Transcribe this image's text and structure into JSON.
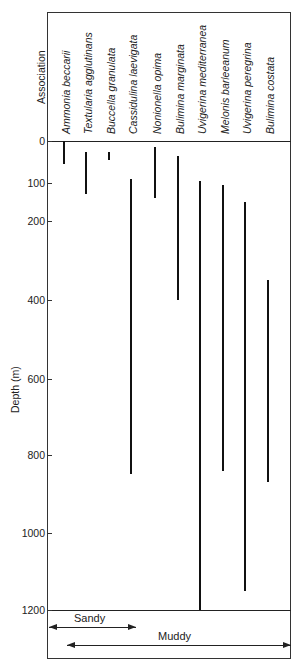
{
  "chart_data": {
    "type": "range-bar",
    "title": "",
    "xlabel": "Association",
    "ylabel": "Depth (m)",
    "ylim": [
      0,
      1200
    ],
    "y_inverted": true,
    "grid": false,
    "yticks": [
      0,
      100,
      200,
      400,
      600,
      800,
      1000,
      1200
    ],
    "categories": [
      "Ammonia beccarii",
      "Textularia agglutinans",
      "Buccella granulata",
      "Cassidulina laevigata",
      "Nonionella opima",
      "Bulimina marginata",
      "Uvigerina mediterranea",
      "Melonis barleeanum",
      "Uvigerina peregrina",
      "Bulimina costata"
    ],
    "ranges": [
      {
        "species": "Ammonia beccarii",
        "top": 0,
        "bottom": 55
      },
      {
        "species": "Textularia agglutinans",
        "top": 25,
        "bottom": 130
      },
      {
        "species": "Buccella granulata",
        "top": 25,
        "bottom": 45
      },
      {
        "species": "Cassidulina laevigata",
        "top": 90,
        "bottom": 850
      },
      {
        "species": "Nonionella opima",
        "top": 15,
        "bottom": 140
      },
      {
        "species": "Bulimina marginata",
        "top": 35,
        "bottom": 400
      },
      {
        "species": "Uvigerina mediterranea",
        "top": 95,
        "bottom": 1200
      },
      {
        "species": "Melonis barleeanum",
        "top": 105,
        "bottom": 840
      },
      {
        "species": "Uvigerina peregrina",
        "top": 150,
        "bottom": 1150
      },
      {
        "species": "Bulimina costata",
        "top": 350,
        "bottom": 870
      }
    ],
    "annotations": [
      {
        "label": "Sandy",
        "type": "double-arrow",
        "from": "Ammonia beccarii",
        "to": "Cassidulina laevigata"
      },
      {
        "label": "Muddy",
        "type": "double-arrow",
        "from": "Textularia agglutinans",
        "to": "Bulimina costata"
      }
    ]
  },
  "layout": {
    "tick_pixels": [
      141,
      183,
      221,
      300,
      379,
      455,
      533,
      610
    ],
    "bar_x": [
      64,
      86,
      109,
      131,
      155,
      178,
      200,
      223,
      245,
      268
    ],
    "label_x": [
      60,
      82,
      105,
      127,
      151,
      174,
      196,
      219,
      241,
      264
    ],
    "label_bottom_y": 134,
    "colors": {
      "ink": "#111111",
      "frame": "#333333",
      "background": "#ffffff"
    }
  },
  "labels": {
    "association": "Association",
    "depth": "Depth (m)",
    "sandy": "Sandy",
    "muddy": "Muddy"
  }
}
